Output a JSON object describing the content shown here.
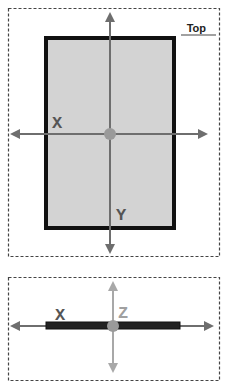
{
  "top_view": {
    "title": "Top",
    "x_label": "X",
    "y_label": "Y"
  },
  "side_view": {
    "x_label": "X",
    "z_label": "Z"
  },
  "colors": {
    "frame_dash": "#444444",
    "panel_fill": "#d3d3d3",
    "panel_border": "#111111",
    "axis": "#6e6e6e",
    "z_axis": "#a8a8a8",
    "origin": "#9a9a9a",
    "label": "#555555",
    "z_label": "#a0a0a0"
  }
}
